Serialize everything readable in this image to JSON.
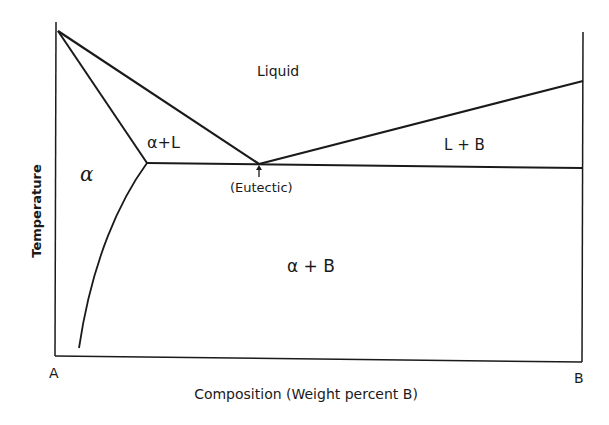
{
  "diagram": {
    "axes": {
      "ylabel": "Temperature",
      "xlabel": "Composition (Weight percent B)",
      "left_component": "A",
      "right_component": "B"
    },
    "regions": {
      "liquid": "Liquid",
      "alpha": "α",
      "alpha_liquid": "α+L",
      "liquid_b": "L + B",
      "alpha_b": "α + B"
    },
    "annotations": {
      "eutectic": "(Eutectic)"
    },
    "colors": {
      "line": "#1a1a1a",
      "background": "#ffffff"
    }
  }
}
